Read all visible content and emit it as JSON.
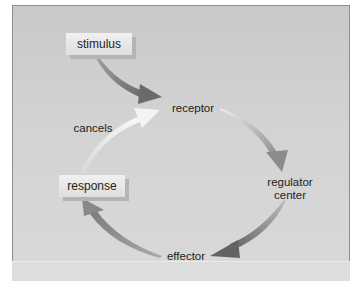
{
  "diagram": {
    "type": "feedback-loop",
    "nodes": {
      "stimulus": "stimulus",
      "receptor": "receptor",
      "regulator_line1": "regulator",
      "regulator_line2": "center",
      "effector": "effector",
      "response": "response",
      "cancels": "cancels"
    },
    "edges": [
      {
        "from": "stimulus",
        "to": "receptor"
      },
      {
        "from": "receptor",
        "to": "regulator center"
      },
      {
        "from": "regulator center",
        "to": "effector"
      },
      {
        "from": "effector",
        "to": "response"
      },
      {
        "from": "response",
        "to": "receptor",
        "label": "cancels"
      }
    ],
    "colors": {
      "background": "#d2d2d2",
      "box": "#e8e8e8",
      "arrow_dark": "#6a6a6a",
      "arrow_mid": "#8c8c8c",
      "arrow_light": "#f2f2f2"
    }
  }
}
